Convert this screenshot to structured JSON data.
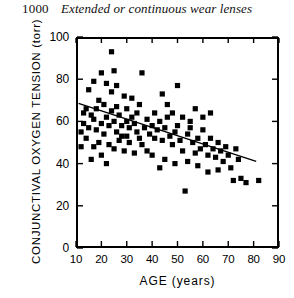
{
  "page": {
    "folio": "1000",
    "running_head": "Extended or continuous wear lenses"
  },
  "chart_data": {
    "type": "scatter",
    "title": "",
    "xlabel": "AGE  (years)",
    "ylabel": "CONJUNCTIVAL OXYGEN TENSION (torr)",
    "xlim": [
      10,
      90
    ],
    "ylim": [
      0,
      100
    ],
    "xticks": [
      10,
      20,
      30,
      40,
      50,
      60,
      70,
      80,
      90
    ],
    "yticks": [
      0,
      20,
      40,
      60,
      80,
      100
    ],
    "grid": false,
    "legend": "none",
    "marker": "filled-square",
    "marker_color": "#000000",
    "trendline": {
      "label": "regression line",
      "x": [
        11,
        81
      ],
      "y": [
        68.5,
        41.0
      ],
      "color": "#000000"
    },
    "points": [
      {
        "x": 24,
        "y": 93
      },
      {
        "x": 20,
        "y": 83
      },
      {
        "x": 25,
        "y": 84
      },
      {
        "x": 22,
        "y": 78
      },
      {
        "x": 26,
        "y": 77
      },
      {
        "x": 24,
        "y": 74
      },
      {
        "x": 36,
        "y": 83
      },
      {
        "x": 17,
        "y": 79
      },
      {
        "x": 15,
        "y": 75
      },
      {
        "x": 50,
        "y": 77
      },
      {
        "x": 44,
        "y": 73
      },
      {
        "x": 19,
        "y": 70
      },
      {
        "x": 21,
        "y": 68
      },
      {
        "x": 14,
        "y": 66
      },
      {
        "x": 16,
        "y": 63
      },
      {
        "x": 17,
        "y": 61
      },
      {
        "x": 13,
        "y": 59
      },
      {
        "x": 15,
        "y": 57
      },
      {
        "x": 12,
        "y": 55
      },
      {
        "x": 18,
        "y": 56
      },
      {
        "x": 20,
        "y": 59
      },
      {
        "x": 22,
        "y": 62
      },
      {
        "x": 23,
        "y": 58
      },
      {
        "x": 25,
        "y": 60
      },
      {
        "x": 27,
        "y": 63
      },
      {
        "x": 28,
        "y": 58
      },
      {
        "x": 30,
        "y": 66
      },
      {
        "x": 30,
        "y": 60
      },
      {
        "x": 31,
        "y": 57
      },
      {
        "x": 32,
        "y": 62
      },
      {
        "x": 33,
        "y": 59
      },
      {
        "x": 34,
        "y": 64
      },
      {
        "x": 26,
        "y": 67
      },
      {
        "x": 24,
        "y": 65
      },
      {
        "x": 21,
        "y": 54
      },
      {
        "x": 19,
        "y": 50
      },
      {
        "x": 17,
        "y": 48
      },
      {
        "x": 23,
        "y": 49
      },
      {
        "x": 25,
        "y": 47
      },
      {
        "x": 27,
        "y": 51
      },
      {
        "x": 29,
        "y": 46
      },
      {
        "x": 31,
        "y": 50
      },
      {
        "x": 33,
        "y": 45
      },
      {
        "x": 35,
        "y": 52
      },
      {
        "x": 20,
        "y": 44
      },
      {
        "x": 16,
        "y": 42
      },
      {
        "x": 22,
        "y": 40
      },
      {
        "x": 37,
        "y": 57
      },
      {
        "x": 38,
        "y": 61
      },
      {
        "x": 39,
        "y": 54
      },
      {
        "x": 40,
        "y": 58
      },
      {
        "x": 41,
        "y": 52
      },
      {
        "x": 42,
        "y": 56
      },
      {
        "x": 43,
        "y": 60
      },
      {
        "x": 36,
        "y": 49
      },
      {
        "x": 38,
        "y": 46
      },
      {
        "x": 40,
        "y": 44
      },
      {
        "x": 44,
        "y": 51
      },
      {
        "x": 45,
        "y": 57
      },
      {
        "x": 46,
        "y": 62
      },
      {
        "x": 47,
        "y": 53
      },
      {
        "x": 48,
        "y": 49
      },
      {
        "x": 49,
        "y": 55
      },
      {
        "x": 50,
        "y": 58
      },
      {
        "x": 51,
        "y": 51
      },
      {
        "x": 52,
        "y": 46
      },
      {
        "x": 53,
        "y": 27
      },
      {
        "x": 54,
        "y": 54
      },
      {
        "x": 55,
        "y": 57
      },
      {
        "x": 56,
        "y": 50
      },
      {
        "x": 57,
        "y": 45
      },
      {
        "x": 58,
        "y": 52
      },
      {
        "x": 59,
        "y": 47
      },
      {
        "x": 60,
        "y": 56
      },
      {
        "x": 61,
        "y": 49
      },
      {
        "x": 62,
        "y": 44
      },
      {
        "x": 63,
        "y": 52
      },
      {
        "x": 64,
        "y": 47
      },
      {
        "x": 65,
        "y": 43
      },
      {
        "x": 66,
        "y": 50
      },
      {
        "x": 60,
        "y": 62
      },
      {
        "x": 63,
        "y": 64
      },
      {
        "x": 57,
        "y": 66
      },
      {
        "x": 67,
        "y": 46
      },
      {
        "x": 68,
        "y": 41
      },
      {
        "x": 69,
        "y": 48
      },
      {
        "x": 70,
        "y": 44
      },
      {
        "x": 71,
        "y": 38
      },
      {
        "x": 72,
        "y": 32
      },
      {
        "x": 74,
        "y": 42
      },
      {
        "x": 75,
        "y": 33
      },
      {
        "x": 77,
        "y": 31
      },
      {
        "x": 82,
        "y": 32
      },
      {
        "x": 73,
        "y": 47
      },
      {
        "x": 66,
        "y": 37
      },
      {
        "x": 62,
        "y": 36
      },
      {
        "x": 58,
        "y": 39
      },
      {
        "x": 54,
        "y": 41
      },
      {
        "x": 49,
        "y": 40
      },
      {
        "x": 45,
        "y": 42
      },
      {
        "x": 43,
        "y": 38
      },
      {
        "x": 41,
        "y": 64
      },
      {
        "x": 35,
        "y": 68
      },
      {
        "x": 32,
        "y": 71
      },
      {
        "x": 29,
        "y": 72
      },
      {
        "x": 46,
        "y": 68
      },
      {
        "x": 52,
        "y": 62
      },
      {
        "x": 48,
        "y": 64
      },
      {
        "x": 55,
        "y": 60
      },
      {
        "x": 28,
        "y": 53
      },
      {
        "x": 26,
        "y": 55
      },
      {
        "x": 34,
        "y": 55
      },
      {
        "x": 30,
        "y": 53
      },
      {
        "x": 18,
        "y": 66
      },
      {
        "x": 14,
        "y": 52
      },
      {
        "x": 12,
        "y": 48
      },
      {
        "x": 13,
        "y": 64
      }
    ]
  }
}
